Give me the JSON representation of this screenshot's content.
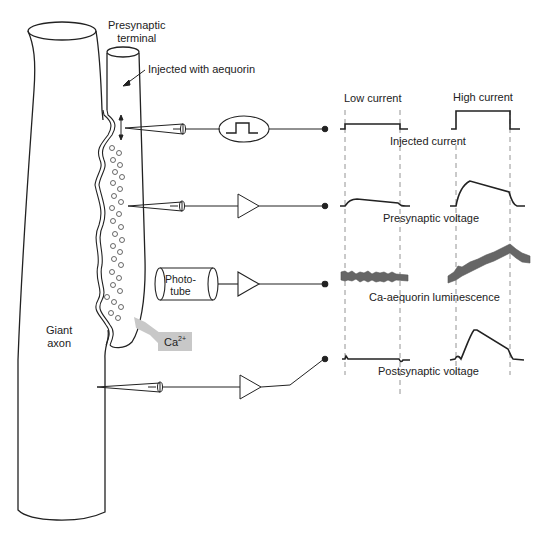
{
  "labels": {
    "presynaptic_terminal_line1": "Presynaptic",
    "presynaptic_terminal_line2": "terminal",
    "injected_with": "Injected with aequorin",
    "giant_axon_line1": "Giant",
    "giant_axon_line2": "axon",
    "ca_ion": "Ca",
    "ca_charge": "2+",
    "phototube_line1": "Photo-",
    "phototube_line2": "tube"
  },
  "traces": {
    "column_headers": [
      "Low current",
      "High current"
    ],
    "rows": [
      {
        "label": "Injected current"
      },
      {
        "label": "Presynaptic voltage"
      },
      {
        "label": "Ca-aequorin luminescence"
      },
      {
        "label": "Postsynaptic voltage"
      }
    ]
  },
  "colors": {
    "line": "#222222",
    "ca_highlight": "#c8c8c8",
    "luminescence_trace": "#555555"
  }
}
